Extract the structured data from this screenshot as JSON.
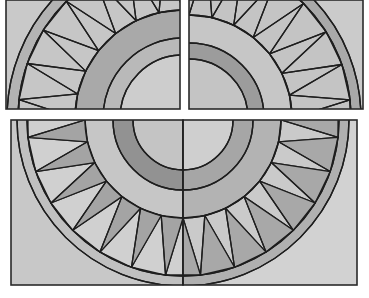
{
  "image": {
    "description": "Quilt-style sunburst / mariner's compass pattern split into three panels",
    "background": "#ffffff",
    "stroke": "#1e1e1e"
  },
  "panels": [
    {
      "name": "top-left-panel",
      "rect": [
        6,
        0,
        174,
        109
      ],
      "center": [
        183,
        118
      ],
      "quadrant": "top-left",
      "fill": "#c9c9c9",
      "rings": [
        {
          "r": 63,
          "fill": "#cdcdcd"
        },
        {
          "r": 80,
          "fill": "#b9b9b9"
        },
        {
          "r": 108,
          "fill": "#a9a9a9"
        },
        {
          "r": 165,
          "fill": "#c6c6c6"
        },
        {
          "r": 176,
          "fill": "#b3b3b3"
        }
      ],
      "teeth": {
        "count": 7,
        "inner_r": 108,
        "outer_r": 165,
        "shade": null
      }
    },
    {
      "name": "top-right-panel",
      "rect": [
        189,
        0,
        174,
        109
      ],
      "center": [
        189,
        118
      ],
      "quadrant": "top-right",
      "fill": "#cbcbcb",
      "rings": [
        {
          "r": 59,
          "fill": "#c4c4c4"
        },
        {
          "r": 75,
          "fill": "#9c9c9c"
        },
        {
          "r": 103,
          "fill": "#c6c6c6"
        },
        {
          "r": 162,
          "fill": "#c4c4c4"
        },
        {
          "r": 172,
          "fill": "#a9a9a9"
        }
      ],
      "teeth": {
        "count": 7,
        "inner_r": 103,
        "outer_r": 162,
        "shade": null
      }
    },
    {
      "name": "bottom-left-panel",
      "rect": [
        11,
        120,
        172,
        165
      ],
      "center": [
        183,
        120
      ],
      "quadrant": "bottom-left",
      "fill": "#c8c8c8",
      "rings": [
        {
          "r": 50,
          "fill": "#c4c4c4"
        },
        {
          "r": 70,
          "fill": "#929292"
        },
        {
          "r": 98,
          "fill": "#c6c6c6"
        },
        {
          "r": 156,
          "fill": "#d0d0d0"
        },
        {
          "r": 166,
          "fill": "#c0c0c0"
        }
      ],
      "teeth": {
        "count": 7,
        "inner_r": 98,
        "outer_r": 156,
        "shade": "#a4a4a4",
        "shade_mode": "outward"
      }
    },
    {
      "name": "bottom-right-panel",
      "rect": [
        183,
        120,
        174,
        165
      ],
      "center": [
        183,
        120
      ],
      "quadrant": "bottom-right",
      "fill": "#d2d2d2",
      "rings": [
        {
          "r": 50,
          "fill": "#cfcfcf"
        },
        {
          "r": 70,
          "fill": "#a6a6a6"
        },
        {
          "r": 98,
          "fill": "#b3b3b3"
        },
        {
          "r": 156,
          "fill": "#cacaca"
        },
        {
          "r": 166,
          "fill": "#b0b0b0"
        }
      ],
      "teeth": {
        "count": 7,
        "inner_r": 98,
        "outer_r": 156,
        "shade": "#a8a8a8",
        "shade_mode": "inward"
      }
    }
  ]
}
